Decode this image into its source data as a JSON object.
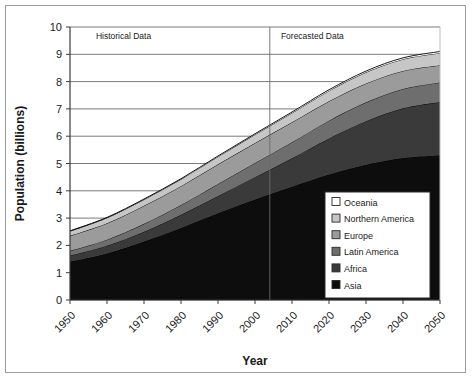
{
  "chart_data": {
    "type": "area",
    "stacked": true,
    "title": "",
    "xlabel": "Year",
    "ylabel": "Population (billions)",
    "xlim": [
      1950,
      2050
    ],
    "ylim": [
      0,
      10
    ],
    "grid": "horizontal",
    "legend_position": "lower-right",
    "x": [
      1950,
      1960,
      1970,
      1980,
      1990,
      2000,
      2010,
      2020,
      2030,
      2040,
      2050
    ],
    "xticklabels": [
      "1950",
      "1960",
      "1970",
      "1980",
      "1990",
      "2000",
      "2010",
      "2020",
      "2030",
      "2040",
      "2050"
    ],
    "yticklabels": [
      "0",
      "1",
      "2",
      "3",
      "4",
      "5",
      "6",
      "7",
      "8",
      "9",
      "10"
    ],
    "series": [
      {
        "name": "Asia",
        "color": "#0d0d0d",
        "values": [
          1.4,
          1.7,
          2.14,
          2.64,
          3.18,
          3.68,
          4.15,
          4.6,
          4.95,
          5.2,
          5.3
        ]
      },
      {
        "name": "Africa",
        "color": "#3a3a3a",
        "values": [
          0.23,
          0.29,
          0.36,
          0.48,
          0.63,
          0.82,
          1.04,
          1.32,
          1.6,
          1.82,
          1.95
        ]
      },
      {
        "name": "Latin America",
        "color": "#6e6e6e",
        "values": [
          0.17,
          0.22,
          0.29,
          0.36,
          0.44,
          0.52,
          0.59,
          0.65,
          0.69,
          0.71,
          0.72
        ]
      },
      {
        "name": "Europe",
        "color": "#9b9b9b",
        "values": [
          0.55,
          0.6,
          0.66,
          0.69,
          0.72,
          0.73,
          0.73,
          0.71,
          0.69,
          0.66,
          0.63
        ]
      },
      {
        "name": "Northern America",
        "color": "#c6c6c6",
        "values": [
          0.17,
          0.2,
          0.23,
          0.25,
          0.28,
          0.31,
          0.34,
          0.38,
          0.41,
          0.43,
          0.45
        ]
      },
      {
        "name": "Oceania",
        "color": "#ffffff",
        "values": [
          0.013,
          0.016,
          0.019,
          0.023,
          0.026,
          0.031,
          0.036,
          0.042,
          0.046,
          0.05,
          0.053
        ]
      }
    ],
    "annotations": [
      {
        "name": "historical",
        "text": "Historical Data",
        "x": 1957,
        "y": 9.55
      },
      {
        "name": "forecast",
        "text": "Forecasted Data",
        "x": 2007,
        "y": 9.55
      }
    ],
    "divider": {
      "x": 2004,
      "label": "forecast-divider"
    }
  },
  "legend": {
    "items": [
      {
        "label": "Oceania",
        "color": "#ffffff"
      },
      {
        "label": "Northern America",
        "color": "#c6c6c6"
      },
      {
        "label": "Europe",
        "color": "#9b9b9b"
      },
      {
        "label": "Latin America",
        "color": "#6e6e6e"
      },
      {
        "label": "Africa",
        "color": "#3a3a3a"
      },
      {
        "label": "Asia",
        "color": "#0d0d0d"
      }
    ]
  }
}
